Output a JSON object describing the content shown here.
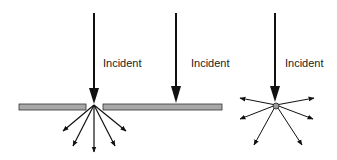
{
  "colors": {
    "plate": "#a8a8a8",
    "plate_stroke": "#333333",
    "arrow": "#111111",
    "particle": "#9a9a9a"
  },
  "panels": [
    {
      "id": "aperture",
      "label": "Incident"
    },
    {
      "id": "opaque-plate",
      "label": "Incident"
    },
    {
      "id": "particle",
      "label": "Incident"
    }
  ]
}
